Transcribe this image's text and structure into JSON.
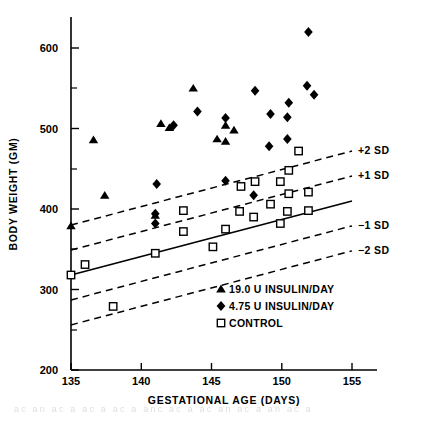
{
  "chart_data": {
    "type": "scatter",
    "title": "",
    "xlabel": "GESTATIONAL AGE (DAYS)",
    "ylabel": "BODY WEIGHT (GM)",
    "xlim": [
      135,
      157
    ],
    "ylim": [
      200,
      630
    ],
    "xticks": [
      135,
      140,
      145,
      150,
      155
    ],
    "yticks": [
      200,
      300,
      400,
      500,
      600
    ],
    "yticks_minor": [
      250,
      350,
      450,
      550
    ],
    "grid": false,
    "legend_position": "inside-bottom-right",
    "series": [
      {
        "name": "19.0 U INSULIN/DAY",
        "marker": "triangle",
        "color": "#000000",
        "points": [
          [
            135.0,
            379
          ],
          [
            136.6,
            486
          ],
          [
            137.4,
            417
          ],
          [
            141.0,
            392
          ],
          [
            141.4,
            506
          ],
          [
            142.0,
            501
          ],
          [
            143.7,
            550
          ],
          [
            145.4,
            487
          ],
          [
            146.0,
            484
          ],
          [
            146.0,
            504
          ],
          [
            146.6,
            498
          ]
        ]
      },
      {
        "name": "4.75 U INSULIN/DAY",
        "marker": "diamond",
        "color": "#000000",
        "points": [
          [
            141.0,
            394
          ],
          [
            141.0,
            382
          ],
          [
            141.1,
            431
          ],
          [
            142.3,
            504
          ],
          [
            144.0,
            521
          ],
          [
            146.0,
            435
          ],
          [
            146.0,
            513
          ],
          [
            148.0,
            417
          ],
          [
            148.1,
            547
          ],
          [
            149.1,
            478
          ],
          [
            149.2,
            518
          ],
          [
            150.4,
            487
          ],
          [
            150.4,
            514
          ],
          [
            150.5,
            532
          ],
          [
            151.8,
            553
          ],
          [
            151.9,
            620
          ],
          [
            152.3,
            542
          ]
        ]
      },
      {
        "name": "CONTROL",
        "marker": "open-square",
        "color": "#000000",
        "points": [
          [
            135.0,
            318
          ],
          [
            136.0,
            331
          ],
          [
            138.0,
            279
          ],
          [
            141.0,
            345
          ],
          [
            143.0,
            398
          ],
          [
            143.0,
            372
          ],
          [
            145.1,
            353
          ],
          [
            146.0,
            375
          ],
          [
            147.0,
            397
          ],
          [
            147.1,
            428
          ],
          [
            148.0,
            390
          ],
          [
            148.1,
            434
          ],
          [
            149.2,
            406
          ],
          [
            149.9,
            382
          ],
          [
            149.9,
            434
          ],
          [
            150.4,
            397
          ],
          [
            150.5,
            419
          ],
          [
            150.5,
            448
          ],
          [
            151.2,
            472
          ],
          [
            151.9,
            398
          ],
          [
            151.9,
            421
          ]
        ]
      }
    ],
    "fit_line": {
      "label": "mean",
      "style": "solid",
      "x": [
        135,
        155
      ],
      "y": [
        318,
        410
      ]
    },
    "sd_lines": [
      {
        "label": "+2 SD",
        "style": "dashed",
        "x": [
          135,
          155
        ],
        "y": [
          380,
          472
        ]
      },
      {
        "label": "+1 SD",
        "style": "dashed",
        "x": [
          135,
          155
        ],
        "y": [
          349,
          441
        ]
      },
      {
        "label": "-1 SD",
        "style": "dashed",
        "x": [
          135,
          155
        ],
        "y": [
          287,
          379
        ]
      },
      {
        "label": "-2 SD",
        "style": "dashed",
        "x": [
          135,
          155
        ],
        "y": [
          256,
          348
        ]
      }
    ],
    "annotations": [
      {
        "text": "+2 SD",
        "x": 155.4,
        "y": 472
      },
      {
        "text": "+1 SD",
        "x": 155.4,
        "y": 441
      },
      {
        "text": "−1 SD",
        "x": 155.4,
        "y": 379
      },
      {
        "text": "−2 SD",
        "x": 155.4,
        "y": 348
      }
    ]
  },
  "axes": {
    "y_title": "BODY WEIGHT (GM)",
    "x_title": "GESTATIONAL AGE (DAYS)",
    "y_tick_labels": [
      "600",
      "500",
      "400",
      "300",
      "200"
    ],
    "x_tick_labels": [
      "135",
      "140",
      "145",
      "150",
      "155"
    ]
  },
  "sd_labels": {
    "plus2": "+2 SD",
    "plus1": "+1 SD",
    "minus1": "−1 SD",
    "minus2": "−2 SD"
  },
  "legend": {
    "items": [
      {
        "marker": "triangle",
        "label": "19.0 U  INSULIN/DAY"
      },
      {
        "marker": "diamond",
        "label": "4.75 U  INSULIN/DAY"
      },
      {
        "marker": "open-square",
        "label": "CONTROL"
      }
    ]
  },
  "caption": {
    "partial_text": "ac  an  ac a  ac  a  ac a  anc  ac  a   ac  an  ac  a   an  ac a"
  },
  "colors": {
    "ink": "#000000",
    "paper": "#ffffff"
  }
}
